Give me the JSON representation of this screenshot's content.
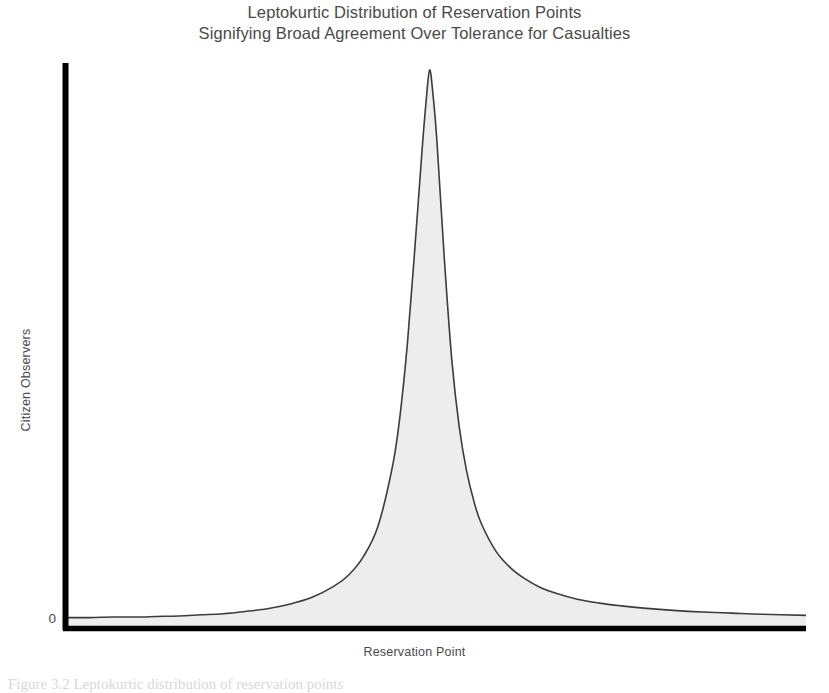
{
  "figure": {
    "background": "#ffffff",
    "title_lines": [
      "Leptokurtic Distribution of Reservation Points",
      "Signifying Broad Agreement Over Tolerance for Casualties"
    ],
    "caption": "Figure 3.2  Leptokurtic distribution of reservation points"
  },
  "chart_data": {
    "type": "area",
    "title": "Leptokurtic Distribution of Reservation Points",
    "subtitle": "Signifying Broad Agreement Over Tolerance for Casualties",
    "xlabel": "Reservation Point",
    "ylabel": "Citizen Observers",
    "grid": false,
    "legend": null,
    "axis_color": "#000000",
    "curve_color": "#3c3c3c",
    "fill_color": "#ededed",
    "xlim": [
      0,
      100
    ],
    "ylim": [
      0,
      100
    ],
    "xticks": [],
    "yticks": [
      0
    ],
    "ytick_labels": [
      "0"
    ],
    "peak_x": 49,
    "peak_y": 100,
    "series": [
      {
        "name": "Citizen Observers",
        "x": [
          0,
          3,
          6,
          9,
          12,
          15,
          18,
          21,
          24,
          27,
          30,
          33,
          36,
          38,
          40,
          42,
          44,
          45,
          46,
          47,
          48,
          48.5,
          49,
          49.5,
          50,
          51,
          52,
          53,
          54,
          55,
          56,
          58,
          60,
          62,
          64,
          66,
          69,
          72,
          75,
          78,
          82,
          86,
          90,
          94,
          100
        ],
        "y": [
          1.6,
          1.6,
          1.7,
          1.7,
          1.8,
          1.9,
          2.1,
          2.3,
          2.7,
          3.2,
          4.0,
          5.2,
          7.2,
          9.2,
          12.5,
          18.0,
          29.0,
          38.0,
          51.0,
          68.0,
          86.0,
          94.0,
          100.0,
          95.0,
          87.0,
          66.0,
          48.0,
          36.0,
          28.0,
          22.5,
          18.5,
          13.5,
          10.5,
          8.5,
          7.0,
          6.0,
          4.9,
          4.2,
          3.7,
          3.3,
          2.9,
          2.6,
          2.4,
          2.2,
          2.0
        ]
      }
    ]
  }
}
